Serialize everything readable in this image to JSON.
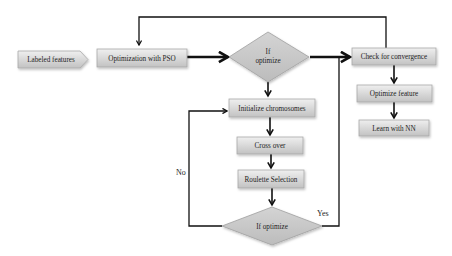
{
  "diagram": {
    "type": "flowchart",
    "nodes": {
      "labeled_features": "Labeled features",
      "pso": "Optimization with PSO",
      "if_optimize_top_line1": "If",
      "if_optimize_top_line2": "optimize",
      "check_convergence": "Check for convergence",
      "optimize_feature": "Optimize feature",
      "learn_nn": "Learn with NN",
      "init_chromosomes": "Initialize chromosomes",
      "cross_over": "Cross over",
      "roulette": "Roulette Selection",
      "if_optimize_bottom": "If optimize"
    },
    "edge_labels": {
      "no": "No",
      "yes": "Yes"
    },
    "colors": {
      "box_fill_top": "#ececec",
      "box_fill_bottom": "#c4c4c4",
      "diamond_fill": "#c8c8c8",
      "line": "#111111"
    },
    "edges": [
      {
        "from": "labeled_features",
        "to": "pso"
      },
      {
        "from": "pso",
        "to": "if_optimize_top"
      },
      {
        "from": "if_optimize_top",
        "to": "check_convergence"
      },
      {
        "from": "if_optimize_top",
        "to": "init_chromosomes"
      },
      {
        "from": "check_convergence",
        "to": "pso"
      },
      {
        "from": "check_convergence",
        "to": "optimize_feature"
      },
      {
        "from": "optimize_feature",
        "to": "learn_nn"
      },
      {
        "from": "init_chromosomes",
        "to": "cross_over"
      },
      {
        "from": "cross_over",
        "to": "roulette"
      },
      {
        "from": "roulette",
        "to": "if_optimize_bottom"
      },
      {
        "from": "if_optimize_bottom",
        "to": "init_chromosomes",
        "label": "No"
      },
      {
        "from": "if_optimize_bottom",
        "to": "check_convergence",
        "label": "Yes"
      }
    ]
  }
}
